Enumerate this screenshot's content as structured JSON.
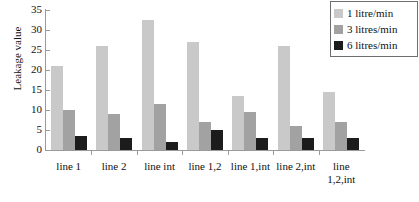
{
  "chart_data": {
    "type": "bar",
    "title": "",
    "xlabel": "",
    "ylabel": "Leakage value",
    "ylim": [
      0,
      35
    ],
    "yticks": [
      0,
      5,
      10,
      15,
      20,
      25,
      30,
      35
    ],
    "grid": false,
    "legend_position": "top-right",
    "categories": [
      "line 1",
      "line 2",
      "line int",
      "line 1,2",
      "line 1,int",
      "line 2,int",
      "line 1,2,int"
    ],
    "series": [
      {
        "name": "1 litre/min",
        "color": "#c9c9c9",
        "values": [
          21,
          26,
          32.5,
          27,
          13.5,
          26,
          14.5
        ]
      },
      {
        "name": "3 litres/min",
        "color": "#a2a2a2",
        "values": [
          10,
          9,
          11.5,
          7,
          9.5,
          6,
          7
        ]
      },
      {
        "name": "6 litres/min",
        "color": "#1c1c1c",
        "values": [
          3.5,
          3,
          2,
          5,
          3,
          3,
          3
        ]
      }
    ]
  },
  "legend": {
    "items": [
      {
        "label": "1 litre/min",
        "color": "#c9c9c9"
      },
      {
        "label": "3 litres/min",
        "color": "#a2a2a2"
      },
      {
        "label": "6 litres/min",
        "color": "#1c1c1c"
      }
    ]
  }
}
